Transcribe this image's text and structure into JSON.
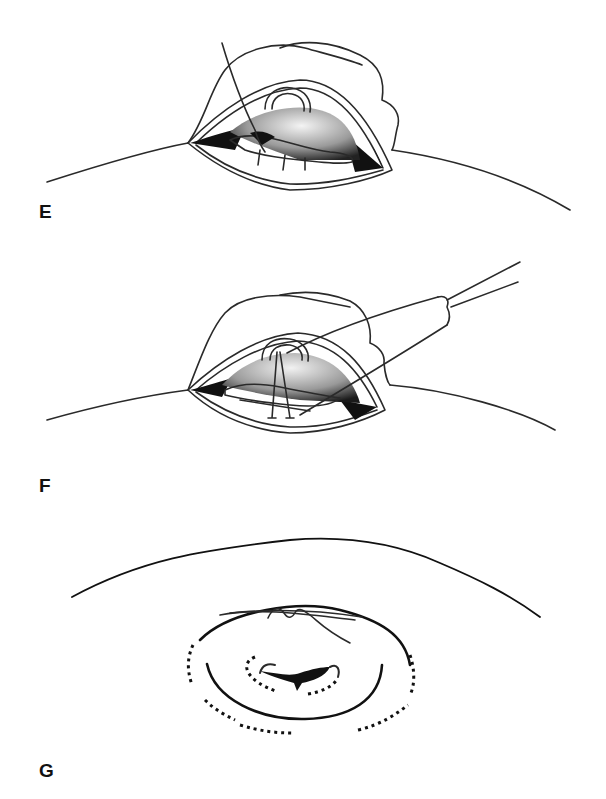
{
  "figure": {
    "type": "surgical-illustration-sequence",
    "panels": [
      {
        "id": "E",
        "label": "E",
        "description": "Incision opened showing cavity with suture needle passing through tissue edge"
      },
      {
        "id": "F",
        "label": "F",
        "description": "Instrument drawing sutures through tissue within the opened incision"
      },
      {
        "id": "G",
        "label": "G",
        "description": "Closed incision with purse-string pattern shown by dotted lines"
      }
    ]
  },
  "colors": {
    "line": "#2a2a2a",
    "shadow_dark": "#111111",
    "shade_light": "#e8e8e8",
    "background": "#ffffff"
  }
}
